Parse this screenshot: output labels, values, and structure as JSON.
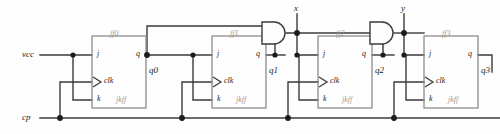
{
  "diagram": {
    "type": "logic-circuit-schematic",
    "stroke_color": "#3a3a3a",
    "label_color": "#1c1c1c",
    "faded_label_color": "#9a9a9a",
    "background": "#fefefe"
  },
  "inputs": [
    {
      "id": "vcc",
      "label": "vcc",
      "x": 22,
      "y": 50
    },
    {
      "id": "cp",
      "label": "cp",
      "x": 22,
      "y": 113
    }
  ],
  "flipflops": [
    {
      "id": "ff0",
      "name": "ff0",
      "kind": "jkff",
      "kind_label": "jkff",
      "box": {
        "x": 92,
        "y": 36,
        "w": 54,
        "h": 72
      },
      "pins": {
        "j": "j",
        "clk": "clk",
        "k": "k",
        "q": "q"
      },
      "output": {
        "label": "q0",
        "x": 149,
        "y": 66
      }
    },
    {
      "id": "ff1",
      "name": "ff1",
      "kind": "jkff",
      "kind_label": "jkff",
      "box": {
        "x": 212,
        "y": 36,
        "w": 54,
        "h": 72
      },
      "pins": {
        "j": "j",
        "clk": "clk",
        "k": "k",
        "q": "q"
      },
      "output": {
        "label": "q1",
        "x": 269,
        "y": 66
      }
    },
    {
      "id": "ff2",
      "name": "ff2",
      "kind": "jkff",
      "kind_label": "jkff",
      "box": {
        "x": 318,
        "y": 36,
        "w": 54,
        "h": 72
      },
      "pins": {
        "j": "j",
        "clk": "clk",
        "k": "k",
        "q": "q"
      },
      "output": {
        "label": "q2",
        "x": 337,
        "y": 66
      }
    },
    {
      "id": "ff3",
      "name": "ff3",
      "kind": "jkff",
      "kind_label": "jkff",
      "box": {
        "x": 424,
        "y": 36,
        "w": 54,
        "h": 72
      },
      "pins": {
        "j": "j",
        "clk": "clk",
        "k": "k",
        "q": "q"
      },
      "output": {
        "label": "q3",
        "x": 481,
        "y": 66
      }
    }
  ],
  "gates": [
    {
      "id": "and1",
      "type": "and",
      "x": 262,
      "y": 22,
      "w": 24,
      "h": 22
    },
    {
      "id": "and2",
      "type": "and",
      "x": 370,
      "y": 22,
      "w": 24,
      "h": 22
    }
  ],
  "nets": [
    {
      "id": "x",
      "label": "x",
      "x": 285,
      "y": 10
    },
    {
      "id": "y",
      "label": "y",
      "x": 402,
      "y": 10
    }
  ],
  "junction_count": 16
}
